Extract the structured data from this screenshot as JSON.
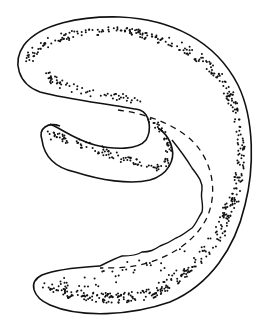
{
  "figure": {
    "colors": {
      "background": "#ffffff",
      "ink": "#111111"
    },
    "elements": [
      {
        "name": "body-outline",
        "style": "solid"
      },
      {
        "name": "inner-lobe-outline",
        "style": "solid"
      },
      {
        "name": "wavy-inner-edge",
        "style": "solid"
      },
      {
        "name": "dashed-line",
        "style": "dashed"
      },
      {
        "name": "stippling",
        "style": "dots"
      }
    ]
  }
}
